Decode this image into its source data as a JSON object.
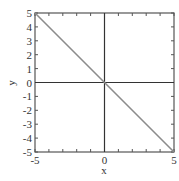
{
  "chart_data": {
    "type": "line",
    "title": "",
    "xlabel": "x",
    "ylabel": "y",
    "xlim": [
      -5,
      5
    ],
    "ylim": [
      -5,
      5
    ],
    "x_ticks": [
      -5,
      0,
      5
    ],
    "x_tick_labels": [
      "-5",
      "0",
      "5"
    ],
    "y_ticks": [
      -5,
      -4,
      -3,
      -2,
      -1,
      0,
      1,
      2,
      3,
      4,
      5
    ],
    "y_tick_labels": [
      "-5",
      "-4",
      "-3",
      "-2",
      "-1",
      "0",
      "1",
      "2",
      "3",
      "4",
      "5"
    ],
    "minor_ticks_every": 1,
    "grid": false,
    "zero_axes": true,
    "legend": null,
    "series": [
      {
        "name": "y = -x",
        "x": [
          -5,
          5
        ],
        "y": [
          5,
          -5
        ],
        "color": "#8c8c8c"
      }
    ]
  },
  "colors": {
    "frame": "#555555",
    "zero_axes": "#333333",
    "line": "#8c8c8c",
    "text": "#333333"
  }
}
